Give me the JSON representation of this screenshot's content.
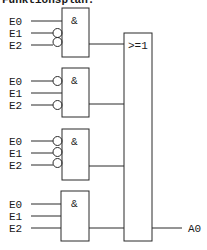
{
  "title": "Funktionsplan:",
  "gates": [
    {
      "type": "AND",
      "symbol": "&",
      "inputs": [
        {
          "label": "E0",
          "inverted": false
        },
        {
          "label": "E1",
          "inverted": true
        },
        {
          "label": "E2",
          "inverted": true
        }
      ]
    },
    {
      "type": "AND",
      "symbol": "&",
      "inputs": [
        {
          "label": "E0",
          "inverted": true
        },
        {
          "label": "E1",
          "inverted": false
        },
        {
          "label": "E2",
          "inverted": true
        }
      ]
    },
    {
      "type": "AND",
      "symbol": "&",
      "inputs": [
        {
          "label": "E0",
          "inverted": true
        },
        {
          "label": "E1",
          "inverted": true
        },
        {
          "label": "E2",
          "inverted": true
        }
      ]
    },
    {
      "type": "AND",
      "symbol": "&",
      "inputs": [
        {
          "label": "E0",
          "inverted": false
        },
        {
          "label": "E1",
          "inverted": false
        },
        {
          "label": "E2",
          "inverted": false
        }
      ]
    }
  ],
  "or_gate": {
    "type": "OR",
    "symbol": ">=1"
  },
  "output": {
    "label": "A0"
  },
  "colors": {
    "line": "#2a2a2a",
    "background": "#ffffff"
  }
}
